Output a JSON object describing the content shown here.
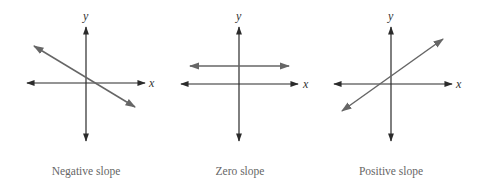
{
  "colors": {
    "axis": "#2b2b2b",
    "line": "#666666",
    "caption": "#666666",
    "background": "#ffffff"
  },
  "panels": [
    {
      "id": "negative",
      "caption": "Negative slope",
      "x_label": "x",
      "y_label": "y",
      "origin": [
        86,
        83
      ],
      "x_axis": [
        27,
        145
      ],
      "y_axis": [
        27,
        141
      ],
      "line": [
        [
          34,
          46
        ],
        [
          135,
          107
        ]
      ]
    },
    {
      "id": "zero",
      "caption": "Zero slope",
      "x_label": "x",
      "y_label": "y",
      "origin": [
        239,
        84
      ],
      "x_axis": [
        181,
        298
      ],
      "y_axis": [
        27,
        141
      ],
      "line": [
        [
          190,
          66
        ],
        [
          289,
          66
        ]
      ]
    },
    {
      "id": "positive",
      "caption": "Positive slope",
      "x_label": "x",
      "y_label": "y",
      "origin": [
        391,
        84
      ],
      "x_axis": [
        334,
        452
      ],
      "y_axis": [
        27,
        141
      ],
      "line": [
        [
          342,
          111
        ],
        [
          443,
          39
        ]
      ]
    }
  ]
}
